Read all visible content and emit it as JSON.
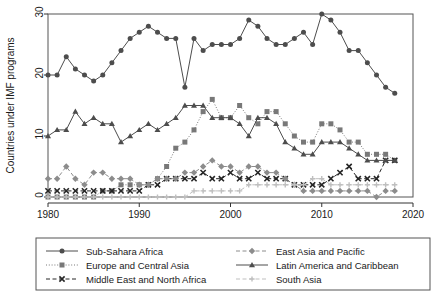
{
  "chart_data": {
    "type": "line",
    "title": "",
    "xlabel": "",
    "ylabel": "Countries under IMF programs",
    "xlim": [
      1980,
      2020
    ],
    "ylim": [
      0,
      30
    ],
    "xticks": [
      1980,
      1990,
      2000,
      2010,
      2020
    ],
    "yticks": [
      0,
      10,
      20,
      30
    ],
    "grid": false,
    "legend_position": "below",
    "x": [
      1980,
      1981,
      1982,
      1983,
      1984,
      1985,
      1986,
      1987,
      1988,
      1989,
      1990,
      1991,
      1992,
      1993,
      1994,
      1995,
      1996,
      1997,
      1998,
      1999,
      2000,
      2001,
      2002,
      2003,
      2004,
      2005,
      2006,
      2007,
      2008,
      2009,
      2010,
      2011,
      2012,
      2013,
      2014,
      2015,
      2016,
      2017,
      2018
    ],
    "series": [
      {
        "name": "Sub-Sahara Africa",
        "marker": "circle",
        "line": "solid",
        "color": "#4d4d4d",
        "values": [
          20,
          20,
          23,
          21,
          20,
          19,
          20,
          22,
          24,
          26,
          27,
          28,
          27,
          26,
          26,
          18,
          26,
          24,
          25,
          25,
          25,
          26,
          29,
          28,
          26,
          25,
          25,
          26,
          27,
          25,
          30,
          29,
          27,
          24,
          24,
          22,
          20,
          18,
          17
        ]
      },
      {
        "name": "Europe and Central Asia",
        "marker": "square",
        "line": "dotted",
        "color": "#787878",
        "values": [
          0,
          0,
          0,
          0,
          0,
          0,
          1,
          1,
          2,
          2,
          2,
          2,
          3,
          5,
          8,
          9,
          11,
          14,
          16,
          13,
          13,
          15,
          13,
          12,
          14,
          14,
          12,
          10,
          9,
          9,
          12,
          12,
          11,
          9,
          9,
          7,
          7,
          7,
          6
        ]
      },
      {
        "name": "Middle East and North Africa",
        "marker": "x",
        "line": "dashed",
        "color": "#262626",
        "values": [
          1,
          1,
          1,
          1,
          1,
          1,
          1,
          1,
          1,
          1,
          1,
          2,
          2,
          3,
          3,
          3,
          3,
          4,
          3,
          3,
          4,
          3,
          3,
          4,
          3,
          3,
          3,
          2,
          2,
          2,
          2,
          3,
          4,
          5,
          3,
          3,
          3,
          6,
          6
        ]
      },
      {
        "name": "East Asia and Pacific",
        "marker": "diamond",
        "line": "dashed",
        "color": "#8c8c8c",
        "values": [
          3,
          3,
          5,
          3,
          2,
          4,
          4,
          3,
          3,
          3,
          2,
          2,
          3,
          3,
          3,
          4,
          4,
          5,
          6,
          5,
          5,
          4,
          5,
          5,
          4,
          4,
          3,
          2,
          1,
          1,
          1,
          1,
          1,
          1,
          1,
          1,
          0,
          1,
          1
        ]
      },
      {
        "name": "Latin America and Caribbean",
        "marker": "triangle",
        "line": "solid",
        "color": "#4d4d4d",
        "values": [
          10,
          11,
          11,
          14,
          12,
          13,
          12,
          12,
          9,
          10,
          11,
          12,
          11,
          12,
          13,
          15,
          15,
          15,
          13,
          13,
          13,
          12,
          10,
          13,
          13,
          12,
          9,
          8,
          7,
          7,
          9,
          9,
          9,
          8,
          7,
          6,
          6,
          6,
          6
        ]
      },
      {
        "name": "South Asia",
        "marker": "plus",
        "line": "dashed",
        "color": "#bfbfbf",
        "values": [
          0,
          0,
          0,
          0,
          0,
          0,
          0,
          0,
          0,
          0,
          0,
          0,
          0,
          0,
          0,
          0,
          1,
          1,
          1,
          1,
          1,
          1,
          2,
          2,
          2,
          2,
          2,
          2,
          2,
          3,
          3,
          2,
          2,
          2,
          2,
          2,
          2,
          2,
          2
        ]
      }
    ]
  },
  "legend": {
    "entries": [
      {
        "label": "Sub-Sahara Africa"
      },
      {
        "label": "East Asia and Pacific"
      },
      {
        "label": "Europe and Central Asia"
      },
      {
        "label": "Latin America and Caribbean"
      },
      {
        "label": "Middle East and North Africa"
      },
      {
        "label": "South Asia"
      }
    ]
  },
  "axes": {
    "y_title": "Countries under IMF programs",
    "y_tick_labels": [
      "0",
      "10",
      "20",
      "30"
    ],
    "x_tick_labels": [
      "1980",
      "1990",
      "2000",
      "2010",
      "2020"
    ]
  }
}
